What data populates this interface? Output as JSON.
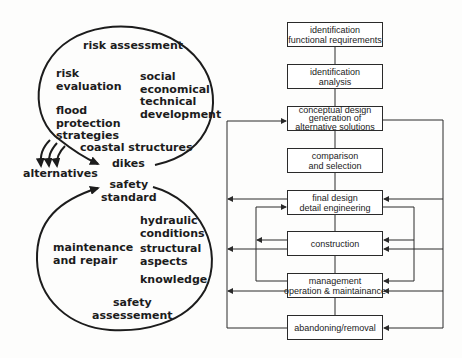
{
  "left_diagram": {
    "top_cycle": {
      "title": "risk assessment",
      "items": {
        "risk_evaluation": [
          "risk",
          "evaluation"
        ],
        "social": [
          "social",
          "economical",
          "technical",
          "development"
        ],
        "flood": [
          "flood",
          "protection",
          "strategies"
        ],
        "coastal": "coastal structures",
        "dikes": "dikes"
      }
    },
    "alternatives": "alternatives",
    "bottom_cycle": {
      "safety_standard": [
        "safety",
        "standard"
      ],
      "hydraulic": [
        "hydraulic",
        "conditions"
      ],
      "maintenance": [
        "maintenance",
        "and repair"
      ],
      "structural": [
        "structural",
        "aspects"
      ],
      "knowledge": "knowledge",
      "safety_assessment": [
        "safety",
        "assessement"
      ]
    }
  },
  "flowchart": {
    "boxes": [
      {
        "lines": [
          "identification",
          "functional requirements"
        ]
      },
      {
        "lines": [
          "identification",
          "analysis"
        ]
      },
      {
        "lines": [
          "conceptual design",
          "generation of",
          "alternative solutions"
        ]
      },
      {
        "lines": [
          "comparison",
          "and selection"
        ]
      },
      {
        "lines": [
          "final design",
          "detail engineering"
        ]
      },
      {
        "lines": [
          "construction"
        ]
      },
      {
        "lines": [
          "management",
          "operation & maintainance"
        ]
      },
      {
        "lines": [
          "abandoning/removal"
        ]
      }
    ]
  },
  "colors": {
    "line": "#2a2a2a",
    "text": "#1c1c1c",
    "background": "#fdfdfc"
  }
}
